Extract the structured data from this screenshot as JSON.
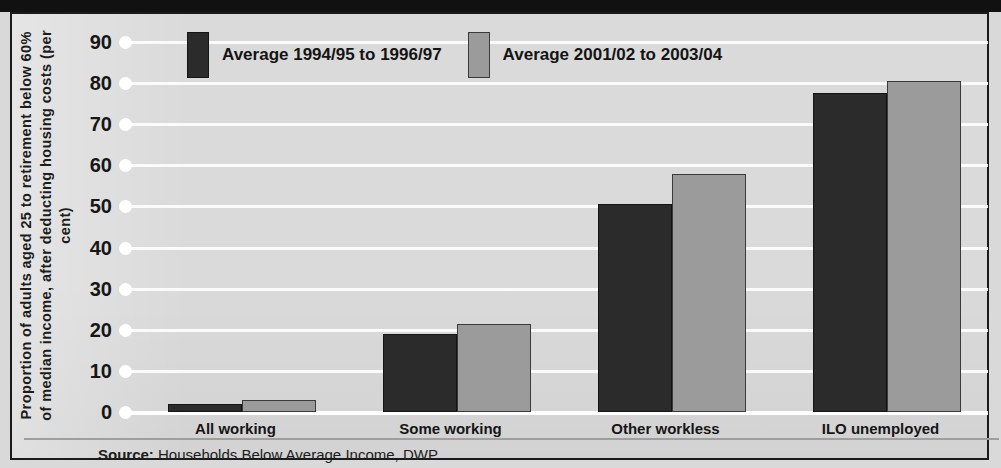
{
  "chart_data": {
    "type": "bar",
    "title": "",
    "xlabel": "",
    "ylabel": "Proportion of adults aged 25 to retirement below 60% of median income, after deducting housing costs (per cent)",
    "ylim": [
      0,
      90
    ],
    "yticks": [
      90,
      80,
      70,
      60,
      50,
      40,
      30,
      20,
      10,
      0
    ],
    "grid": true,
    "legend_position": "top",
    "categories": [
      "All working",
      "Some working",
      "Other workless",
      "ILO unemployed"
    ],
    "series": [
      {
        "name": "Average 1994/95 to 1996/97",
        "color": "#2b2b2b",
        "values": [
          2,
          19,
          50.5,
          77.5
        ]
      },
      {
        "name": "Average 2001/02 to 2003/04",
        "color": "#9b9b9b",
        "values": [
          3,
          21.5,
          58,
          80.5
        ]
      }
    ],
    "source_prefix": "Source:",
    "source_text": "Households Below Average Income, DWP"
  },
  "colors": {
    "series_1": "#2b2b2b",
    "series_2": "#9b9b9b",
    "paper": "#dadada",
    "gridline": "#ffffff",
    "frame": "#1b1b1b"
  }
}
